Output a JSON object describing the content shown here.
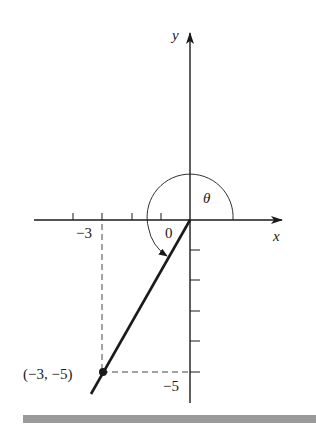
{
  "diagram": {
    "type": "coordinate-angle",
    "axes": {
      "x_label": "x",
      "y_label": "y",
      "origin_label": "0"
    },
    "ticks": {
      "x_label": "−3",
      "y_label": "−5"
    },
    "angle_label": "θ",
    "point": {
      "label": "(−3, −5)",
      "x": -3,
      "y": -5
    },
    "colors": {
      "ink": "#1a1a1a",
      "dashed": "#444444",
      "bar": "#9a9a9a"
    }
  }
}
